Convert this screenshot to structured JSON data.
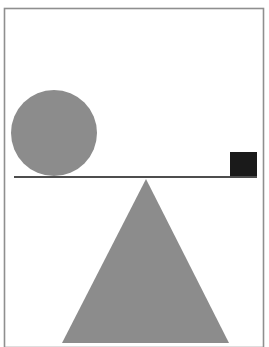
{
  "figure": {
    "description": "A gray circle and a small black square rest on a horizontal beam balanced on a large gray triangular fulcrum.",
    "width": 269,
    "height": 347,
    "background_color": "#ffffff"
  },
  "colors": {
    "shape_gray": "#8c8c8c",
    "square_black": "#1a1a1a",
    "beam_line": "#4d4d4d",
    "frame_border": "#8f8f8f",
    "background": "#ffffff"
  },
  "frame": {
    "label": "image border frame",
    "x": 4.5,
    "y": 8.5,
    "width": 259,
    "height": 339,
    "stroke_width": 1.6
  },
  "shapes": {
    "circle": {
      "label": "Circle",
      "role": "left weight",
      "center_x": 54,
      "center_y": 133,
      "radius": 43,
      "fill": "#8c8c8c"
    },
    "square": {
      "label": "Square",
      "role": "right weight",
      "x": 230,
      "y": 152,
      "width": 27,
      "height": 24,
      "fill": "#1a1a1a"
    },
    "beam": {
      "label": "Beam",
      "role": "lever bar",
      "x1": 14,
      "y1": 177,
      "x2": 257,
      "y2": 177,
      "stroke": "#4d4d4d",
      "stroke_width": 2.2
    },
    "triangle": {
      "label": "Triangle",
      "role": "fulcrum",
      "apex_x": 146,
      "apex_y": 179,
      "base_left_x": 62,
      "base_right_x": 229,
      "base_y": 343,
      "fill": "#8c8c8c",
      "points": "146,179 229,343 62,343"
    }
  }
}
